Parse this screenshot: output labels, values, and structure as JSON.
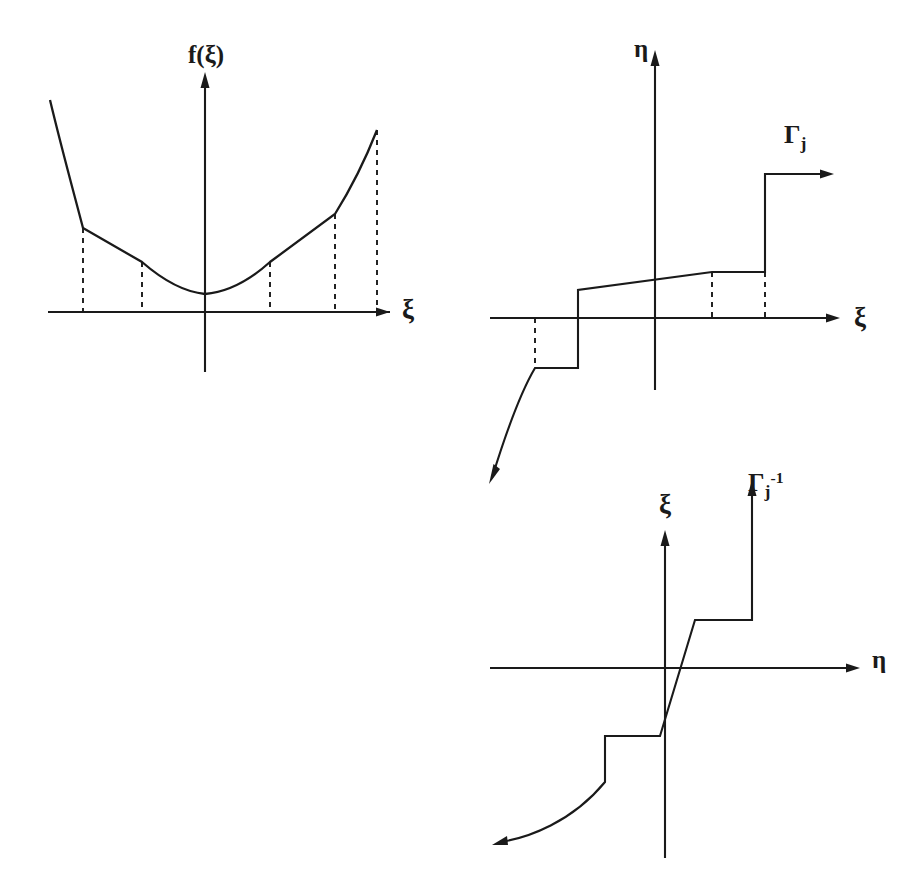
{
  "figure": {
    "background_color": "#ffffff",
    "ink_color": "#1a1a1a",
    "width": 908,
    "height": 883
  },
  "panels": [
    {
      "id": "cost-function",
      "name": "f(xi) convex cost function with quantization breakpoints",
      "y_axis_label": "f(ξ)",
      "x_axis_label": "ξ",
      "origin": {
        "x": 205,
        "y": 312
      },
      "x_axis": {
        "x_start": 48,
        "x_end": 395,
        "y": 312
      },
      "y_axis": {
        "y_top": 72,
        "y_bottom": 372,
        "x": 205
      },
      "dashed_breakpoints": [
        83,
        142,
        270,
        335,
        377
      ],
      "curve_description": "piecewise-linear convex approximation of a parabola, steep at both ends"
    },
    {
      "id": "quantizer-forward",
      "name": "Gamma_j forward staircase quantizer characteristic",
      "y_axis_label": "η",
      "x_axis_label": "ξ",
      "curve_label": "Γ",
      "curve_label_sub": "j",
      "origin": {
        "x": 655,
        "y": 318
      },
      "x_axis": {
        "x_start": 490,
        "x_end": 838,
        "y": 318
      },
      "y_axis": {
        "y_top": 50,
        "y_bottom": 390,
        "x": 655
      },
      "dashed_breakpoints": [
        534,
        712,
        765
      ],
      "steps": [
        {
          "from_x": 534,
          "to_x": 578,
          "level_y": 368
        },
        {
          "from_x": 578,
          "to_x": 712,
          "level_y": 290,
          "sloped": true
        },
        {
          "from_x": 712,
          "to_x": 765,
          "level_y": 272
        },
        {
          "from_x": 765,
          "to_x": 830,
          "level_y": 174
        }
      ],
      "tail_description": "lower-left curved tail descending to an arrow at bottom-left"
    },
    {
      "id": "quantizer-inverse",
      "name": "Gamma_j inverse staircase characteristic",
      "y_axis_label": "ξ",
      "x_axis_label": "η",
      "curve_label": "Γ",
      "curve_label_sub": "j",
      "curve_label_sup": "-1",
      "origin": {
        "x": 665,
        "y": 668
      },
      "x_axis": {
        "x_start": 490,
        "x_end": 840,
        "y": 668
      },
      "y_axis": {
        "y_top": 530,
        "y_bottom": 858,
        "x": 665
      },
      "steps": [
        {
          "from_x": 605,
          "to_x": 660,
          "level_y": 736
        },
        {
          "from_x": 660,
          "to_x": 695,
          "level_y": 620,
          "sloped": true
        },
        {
          "from_x": 695,
          "to_x": 752,
          "level_y": 573
        },
        {
          "from_x": 752,
          "to_x": 752,
          "level_y": 487
        }
      ],
      "tail_description": "lower-left curved tail descending to an arrow at bottom-left and upper vertical rise to arrow at top"
    }
  ],
  "labels": {
    "f_of_xi": "f(ξ)",
    "xi": "ξ",
    "eta": "η",
    "gamma": "Γ",
    "subscript_j": "j",
    "superscript_inverse": "-1"
  }
}
